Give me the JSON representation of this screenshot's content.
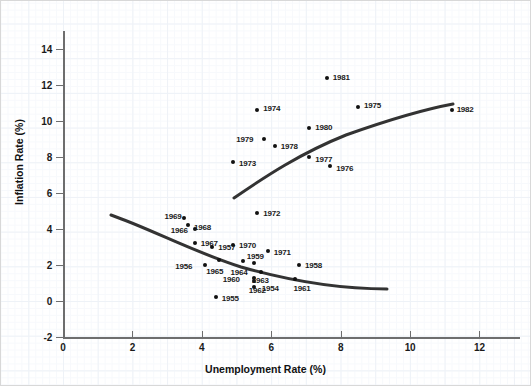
{
  "chart_data": {
    "type": "scatter",
    "title": "",
    "xlabel": "Unemployment Rate (%)",
    "ylabel": "Inflation Rate (%)",
    "xlim": [
      0,
      13.2
    ],
    "ylim": [
      -2,
      15.2
    ],
    "xticks": [
      0,
      2,
      4,
      6,
      8,
      10,
      12
    ],
    "yticks": [
      -2,
      0,
      2,
      4,
      6,
      8,
      10,
      12,
      14
    ],
    "xtick_labels": [
      "0",
      "2",
      "4",
      "6",
      "8",
      "10",
      "12"
    ],
    "ytick_labels": [
      "-2",
      "0",
      "2",
      "4",
      "6",
      "8",
      "10",
      "12",
      "14"
    ],
    "grid": true,
    "legend": "none",
    "point_color": "#111111",
    "curve_color": "#333333",
    "grid_color": "#eef2f7",
    "axis_color": "#6e6e6e",
    "points": [
      {
        "label": "1954",
        "x": 5.5,
        "y": 0.8,
        "lx": 8,
        "ly": -3
      },
      {
        "label": "1955",
        "x": 4.4,
        "y": 0.2,
        "lx": 6,
        "ly": -3
      },
      {
        "label": "1956",
        "x": 4.1,
        "y": 2.0,
        "lx": -30,
        "ly": -3
      },
      {
        "label": "1957",
        "x": 4.3,
        "y": 3.0,
        "lx": 6,
        "ly": -4
      },
      {
        "label": "1958",
        "x": 6.8,
        "y": 2.0,
        "lx": 6,
        "ly": -4
      },
      {
        "label": "1959",
        "x": 5.5,
        "y": 2.1,
        "lx": -7,
        "ly": -11
      },
      {
        "label": "1960",
        "x": 5.5,
        "y": 1.3,
        "lx": -31,
        "ly": -3
      },
      {
        "label": "1961",
        "x": 6.7,
        "y": 1.2,
        "lx": -2,
        "ly": 5
      },
      {
        "label": "1962",
        "x": 5.5,
        "y": 1.1,
        "lx": -5,
        "ly": 5
      },
      {
        "label": "1963",
        "x": 5.7,
        "y": 1.6,
        "lx": -9,
        "ly": 4
      },
      {
        "label": "1964",
        "x": 5.2,
        "y": 2.2,
        "lx": -13,
        "ly": 7
      },
      {
        "label": "1965",
        "x": 4.5,
        "y": 2.3,
        "lx": -13,
        "ly": 7
      },
      {
        "label": "1966",
        "x": 3.8,
        "y": 4.0,
        "lx": -24,
        "ly": -3
      },
      {
        "label": "1967",
        "x": 3.8,
        "y": 3.2,
        "lx": 6,
        "ly": -4
      },
      {
        "label": "1968",
        "x": 3.6,
        "y": 4.2,
        "lx": 6,
        "ly": -2
      },
      {
        "label": "1969",
        "x": 3.5,
        "y": 4.6,
        "lx": -20,
        "ly": -6
      },
      {
        "label": "1970",
        "x": 4.9,
        "y": 3.1,
        "lx": 6,
        "ly": -4
      },
      {
        "label": "1971",
        "x": 5.9,
        "y": 2.8,
        "lx": 6,
        "ly": -3
      },
      {
        "label": "1972",
        "x": 5.6,
        "y": 4.9,
        "lx": 6,
        "ly": -4
      },
      {
        "label": "1973",
        "x": 4.9,
        "y": 7.7,
        "lx": 6,
        "ly": -3
      },
      {
        "label": "1974",
        "x": 5.6,
        "y": 10.6,
        "lx": 6,
        "ly": -6
      },
      {
        "label": "1975",
        "x": 8.5,
        "y": 10.8,
        "lx": 6,
        "ly": -6
      },
      {
        "label": "1976",
        "x": 7.7,
        "y": 7.5,
        "lx": 6,
        "ly": -2
      },
      {
        "label": "1977",
        "x": 7.1,
        "y": 8.0,
        "lx": 6,
        "ly": -2
      },
      {
        "label": "1978",
        "x": 6.1,
        "y": 8.6,
        "lx": 6,
        "ly": -4
      },
      {
        "label": "1979",
        "x": 5.8,
        "y": 9.0,
        "lx": -28,
        "ly": -4
      },
      {
        "label": "1980",
        "x": 7.1,
        "y": 9.6,
        "lx": 6,
        "ly": -5
      },
      {
        "label": "1981",
        "x": 7.6,
        "y": 12.4,
        "lx": 6,
        "ly": -5
      },
      {
        "label": "1982",
        "x": 11.2,
        "y": 10.6,
        "lx": 5,
        "ly": -5
      }
    ],
    "curves": [
      {
        "name": "short-run-phillips-curve-1954-1972",
        "path": "M 110,214 C 150,228 190,250 240,266 C 300,283 345,288 386,288"
      },
      {
        "name": "short-run-phillips-curve-1973-1982",
        "path": "M 233,197 C 265,175 300,152 345,134 C 390,118 425,108 452,103"
      }
    ]
  },
  "axes": {
    "x": {
      "title": "Unemployment Rate (%)",
      "ticks": [
        {
          "value": 0,
          "label": "0"
        },
        {
          "value": 2,
          "label": "2"
        },
        {
          "value": 4,
          "label": "4"
        },
        {
          "value": 6,
          "label": "6"
        },
        {
          "value": 8,
          "label": "8"
        },
        {
          "value": 10,
          "label": "10"
        },
        {
          "value": 12,
          "label": "12"
        }
      ]
    },
    "y": {
      "title": "Inflation Rate (%)",
      "ticks": [
        {
          "value": -2,
          "label": "-2"
        },
        {
          "value": 0,
          "label": "0"
        },
        {
          "value": 2,
          "label": "2"
        },
        {
          "value": 4,
          "label": "4"
        },
        {
          "value": 6,
          "label": "6"
        },
        {
          "value": 8,
          "label": "8"
        },
        {
          "value": 10,
          "label": "10"
        },
        {
          "value": 12,
          "label": "12"
        },
        {
          "value": 14,
          "label": "14"
        }
      ]
    }
  }
}
